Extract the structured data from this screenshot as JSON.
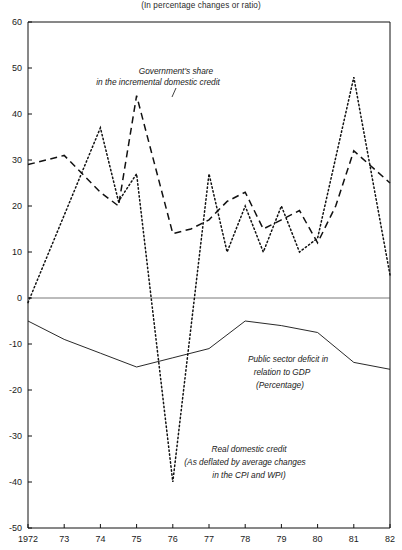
{
  "subtitle": "(In percentage changes or ratio)",
  "annotations": {
    "gov_share": {
      "line1": "Government's share",
      "line2": "in the incremental domestic credit"
    },
    "public_deficit": {
      "line1": "Public sector deficit in",
      "line2": "relation to GDP",
      "line3": "(Percentage)"
    },
    "real_credit": {
      "line1": "Real domestic credit",
      "line2": "(As deflated by average changes",
      "line3": "in the CPI and WPI)"
    }
  },
  "axis": {
    "y_ticks": [
      "60",
      "50",
      "40",
      "30",
      "20",
      "10",
      "0",
      "-10",
      "-20",
      "-30",
      "-40",
      "-50"
    ],
    "x_ticks": [
      "1972",
      "73",
      "74",
      "75",
      "76",
      "77",
      "78",
      "79",
      "80",
      "81",
      "82"
    ]
  },
  "chart_data": {
    "type": "line",
    "title": "",
    "subtitle": "(In percentage changes or ratio)",
    "xlabel": "",
    "ylabel": "",
    "xlim": [
      1972,
      1982
    ],
    "ylim": [
      -50,
      60
    ],
    "ytick_step": 10,
    "grid": false,
    "legend": "annotations-inline",
    "zero_line": true,
    "x": [
      1972,
      1972.5,
      1973,
      1973.5,
      1974,
      1974.5,
      1975,
      1975.5,
      1976,
      1976.5,
      1977,
      1977.5,
      1978,
      1978.5,
      1979,
      1979.5,
      1980,
      1980.5,
      1981,
      1981.5,
      1982
    ],
    "series": [
      {
        "name": "Government's share in the incremental domestic credit",
        "style": "dashed",
        "color": "#111111",
        "x": [
          1972,
          1973,
          1973.5,
          1974,
          1974.5,
          1975,
          1976,
          1976.5,
          1977,
          1977.5,
          1978,
          1978.5,
          1979,
          1979.5,
          1980,
          1980.5,
          1981,
          1982
        ],
        "values": [
          29,
          31,
          27,
          23,
          20,
          44,
          14,
          15,
          17,
          21,
          23,
          15,
          17,
          19,
          12,
          20,
          32,
          25
        ]
      },
      {
        "name": "Real domestic credit (As deflated by average changes in the CPI and WPI)",
        "style": "dotted",
        "color": "#111111",
        "x": [
          1972,
          1974,
          1974.5,
          1975,
          1976,
          1977,
          1977.5,
          1978,
          1978.5,
          1979,
          1979.5,
          1980,
          1981,
          1982
        ],
        "values": [
          -1,
          37,
          21,
          27,
          -40,
          27,
          10,
          20,
          10,
          20,
          10,
          13,
          48,
          5
        ]
      },
      {
        "name": "Public sector deficit in relation to GDP (Percentage)",
        "style": "solid",
        "color": "#111111",
        "x": [
          1972,
          1973,
          1974,
          1975,
          1976,
          1977,
          1978,
          1979,
          1980,
          1981,
          1982
        ],
        "values": [
          -5,
          -9,
          -12,
          -15,
          -13,
          -11,
          -5,
          -6,
          -7.5,
          -14,
          -15.5
        ]
      }
    ]
  }
}
